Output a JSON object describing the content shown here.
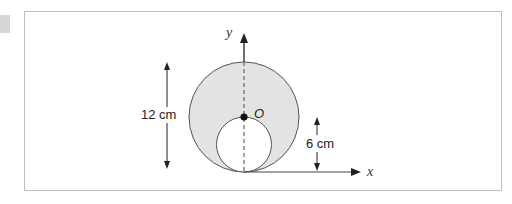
{
  "diagram": {
    "axes": {
      "x_label": "x",
      "y_label": "y"
    },
    "center_point_label": "O",
    "outer_circle": {
      "diameter_label": "12 cm",
      "fill": "#e3e3e3"
    },
    "inner_circle": {
      "diameter_label": "6 cm",
      "fill": "#ffffff"
    },
    "colors": {
      "stroke": "#444444",
      "shading": "#e3e3e3",
      "frame_border": "#bdbdbd"
    }
  }
}
